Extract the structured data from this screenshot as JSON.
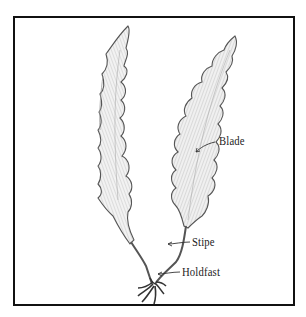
{
  "diagram": {
    "labels": [
      {
        "id": "blade",
        "text": "Blade"
      },
      {
        "id": "stipe",
        "text": "Stipe"
      },
      {
        "id": "holdfast",
        "text": "Holdfast"
      }
    ]
  },
  "colors": {
    "frame": "#111111",
    "ink": "#444444",
    "shade": "#cfcfcf",
    "background": "#ffffff"
  }
}
